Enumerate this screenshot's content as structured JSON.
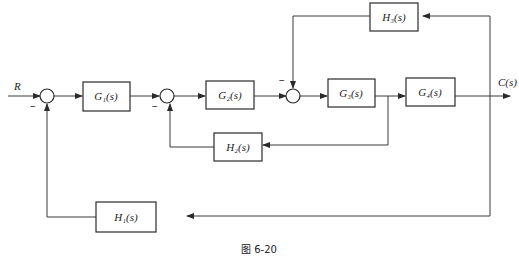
{
  "diagram": {
    "type": "block-diagram",
    "input_label": "R",
    "output_label": "C(s)",
    "blocks": {
      "g1": "G₁(s)",
      "g2": "G₂(s)",
      "g3": "G₃(s)",
      "g4": "G₄(s)",
      "h1": "H₁(s)",
      "h2": "H₂(s)",
      "h3": "H₃(s)"
    },
    "summing_junctions": [
      {
        "id": "s1",
        "sign_label": "−"
      },
      {
        "id": "s2",
        "sign_label": "−"
      },
      {
        "id": "s3",
        "sign_label": "−"
      }
    ],
    "caption": "图 6-20"
  }
}
